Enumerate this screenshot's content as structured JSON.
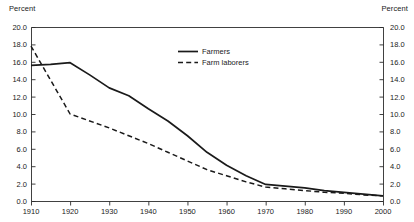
{
  "chart_data": {
    "type": "line",
    "title": "",
    "xlabel": "",
    "ylabel": "Percent",
    "ylabel_right": "Percent",
    "xlim": [
      1910,
      2000
    ],
    "ylim": [
      0.0,
      20.0
    ],
    "grid": false,
    "legend_position": "upper-center",
    "y_ticks": [
      "0.0",
      "2.0",
      "4.0",
      "6.0",
      "8.0",
      "10.0",
      "12.0",
      "14.0",
      "16.0",
      "18.0",
      "20.0"
    ],
    "y_tick_values": [
      0,
      2,
      4,
      6,
      8,
      10,
      12,
      14,
      16,
      18,
      20
    ],
    "x_ticks": [
      "1910",
      "1920",
      "1930",
      "1940",
      "1950",
      "1960",
      "1970",
      "1980",
      "1990",
      "2000"
    ],
    "x_tick_values": [
      1910,
      1920,
      1930,
      1940,
      1950,
      1960,
      1970,
      1980,
      1990,
      2000
    ],
    "x": [
      1910,
      1915,
      1920,
      1925,
      1930,
      1935,
      1940,
      1945,
      1950,
      1955,
      1960,
      1965,
      1970,
      1975,
      1980,
      1985,
      1990,
      1995,
      2000
    ],
    "series": [
      {
        "name": "Farmers",
        "style": "solid",
        "color": "#1a1a1a",
        "values": [
          15.6,
          15.7,
          15.9,
          14.5,
          13.0,
          12.1,
          10.6,
          9.2,
          7.5,
          5.6,
          4.1,
          2.9,
          1.9,
          1.7,
          1.5,
          1.2,
          1.0,
          0.8,
          0.6
        ]
      },
      {
        "name": "Farm laborers",
        "style": "dashed",
        "color": "#1a1a1a",
        "values": [
          17.8,
          13.9,
          10.0,
          9.2,
          8.4,
          7.5,
          6.6,
          5.6,
          4.6,
          3.6,
          2.9,
          2.2,
          1.6,
          1.4,
          1.2,
          1.0,
          0.9,
          0.7,
          0.6
        ]
      }
    ],
    "legend": [
      {
        "label": "Farmers",
        "style": "solid"
      },
      {
        "label": "Farm laborers",
        "style": "dashed"
      }
    ]
  }
}
